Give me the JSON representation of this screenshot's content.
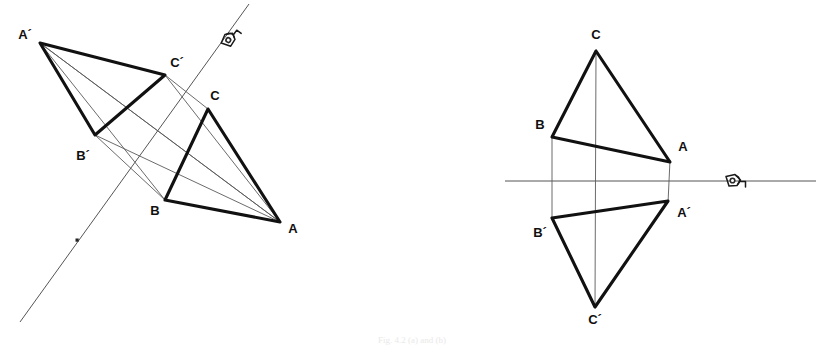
{
  "figure": {
    "caption": "Fig. 4.2 (a) and (b)",
    "background_color": "#ffffff",
    "stroke_color": "#111111",
    "thin_stroke_color": "#5a5a5a",
    "axis_color": "#555555"
  },
  "views": [
    {
      "id": "left-view",
      "name": "oblique-axis-view",
      "axis": {
        "name": "reflection-axis",
        "orientation": "oblique",
        "x1": 20,
        "y1": 322,
        "x2": 249,
        "y2": 4,
        "marker_dot": {
          "x": 77,
          "y": 240,
          "size": 3
        },
        "eye_symbol": {
          "x": 229,
          "y": 40,
          "rotation": -54,
          "label": "eye-symbol"
        }
      },
      "triangles": [
        {
          "name": "triangle-abc-original",
          "vertices": [
            {
              "label": "A",
              "x": 280,
              "y": 222,
              "label_x": 293,
              "label_y": 230
            },
            {
              "label": "B",
              "x": 165,
              "y": 200,
              "label_x": 155,
              "label_y": 212
            },
            {
              "label": "C",
              "x": 208,
              "y": 109,
              "label_x": 215,
              "label_y": 97
            }
          ]
        },
        {
          "name": "triangle-abc-reflected",
          "vertices": [
            {
              "label": "A´",
              "x": 40,
              "y": 43,
              "label_x": 25,
              "label_y": 36
            },
            {
              "label": "B´",
              "x": 95,
              "y": 135,
              "label_x": 83,
              "label_y": 157
            },
            {
              "label": "C´",
              "x": 165,
              "y": 75,
              "label_x": 177,
              "label_y": 64
            }
          ]
        }
      ],
      "connectors": [
        {
          "name": "connector-a-aprime",
          "x1": 280,
          "y1": 222,
          "x2": 40,
          "y2": 43
        },
        {
          "name": "connector-b-bprime",
          "x1": 165,
          "y1": 200,
          "x2": 95,
          "y2": 135
        },
        {
          "name": "connector-c-cprime",
          "x1": 208,
          "y1": 109,
          "x2": 165,
          "y2": 75
        },
        {
          "name": "connector-a-cprime-long",
          "x1": 280,
          "y1": 222,
          "x2": 165,
          "y2": 75
        },
        {
          "name": "connector-aprime-b-long",
          "x1": 40,
          "y1": 43,
          "x2": 165,
          "y2": 200
        },
        {
          "name": "connector-bprime-extend",
          "x1": 95,
          "y1": 135,
          "x2": 280,
          "y2": 222
        }
      ]
    },
    {
      "id": "right-view",
      "name": "horizontal-axis-view",
      "axis": {
        "name": "reflection-axis",
        "orientation": "horizontal",
        "x1": 505,
        "y1": 181,
        "x2": 816,
        "y2": 181,
        "eye_symbol": {
          "x": 733,
          "y": 181,
          "rotation": 0,
          "label": "eye-symbol"
        }
      },
      "triangles": [
        {
          "name": "triangle-abc-original",
          "vertices": [
            {
              "label": "A",
              "x": 670,
              "y": 162,
              "label_x": 683,
              "label_y": 148
            },
            {
              "label": "B",
              "x": 552,
              "y": 137,
              "label_x": 540,
              "label_y": 126
            },
            {
              "label": "C",
              "x": 596,
              "y": 51,
              "label_x": 596,
              "label_y": 36
            }
          ]
        },
        {
          "name": "triangle-abc-reflected",
          "vertices": [
            {
              "label": "A´",
              "x": 668,
              "y": 201,
              "label_x": 684,
              "label_y": 214
            },
            {
              "label": "B´",
              "x": 552,
              "y": 218,
              "label_x": 540,
              "label_y": 234
            },
            {
              "label": "C´",
              "x": 595,
              "y": 307,
              "label_x": 595,
              "label_y": 321
            }
          ]
        }
      ],
      "connectors": [
        {
          "name": "connector-a-aprime",
          "x1": 670,
          "y1": 160,
          "x2": 668,
          "y2": 203
        },
        {
          "name": "connector-b-bprime",
          "x1": 552,
          "y1": 135,
          "x2": 552,
          "y2": 220
        },
        {
          "name": "connector-c-cprime",
          "x1": 596,
          "y1": 51,
          "x2": 595,
          "y2": 307
        }
      ]
    }
  ]
}
